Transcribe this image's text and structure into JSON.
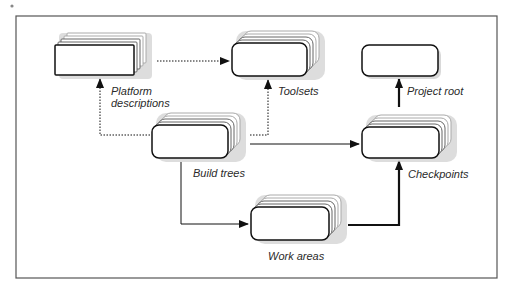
{
  "frame": {
    "x": 16,
    "y": 16,
    "width": 481,
    "height": 262,
    "stroke": "#555555"
  },
  "colors": {
    "box_fill": "#ffffff",
    "box_stroke": "#111111",
    "stack_stroke": "#666666",
    "shadow": "#cfcfcf",
    "line": "#111111"
  },
  "nodes": [
    {
      "id": "platform",
      "label_lines": [
        "Platform",
        "descriptions"
      ],
      "x": 55,
      "y": 45,
      "w": 79,
      "h": 30,
      "r": 1,
      "stacked": true,
      "label_x": 111,
      "label_y": 95
    },
    {
      "id": "toolsets",
      "label_lines": [
        "Toolsets"
      ],
      "x": 232,
      "y": 43,
      "w": 75,
      "h": 33,
      "r": 7,
      "stacked": true,
      "label_x": 278,
      "label_y": 95
    },
    {
      "id": "project_root",
      "label_lines": [
        "Project root"
      ],
      "x": 362,
      "y": 45,
      "w": 76,
      "h": 31,
      "r": 7,
      "stacked": false,
      "label_x": 407,
      "label_y": 95
    },
    {
      "id": "build_trees",
      "label_lines": [
        "Build trees"
      ],
      "x": 152,
      "y": 125,
      "w": 76,
      "h": 33,
      "r": 7,
      "stacked": true,
      "label_x": 193,
      "label_y": 177
    },
    {
      "id": "checkpoints",
      "label_lines": [
        "Checkpoints"
      ],
      "x": 362,
      "y": 127,
      "w": 77,
      "h": 31,
      "r": 7,
      "stacked": true,
      "label_x": 407,
      "label_y": 178
    },
    {
      "id": "work_areas",
      "label_lines": [
        "Work areas"
      ],
      "x": 251,
      "y": 207,
      "w": 78,
      "h": 33,
      "r": 7,
      "stacked": true,
      "label_x": 268,
      "label_y": 260
    }
  ],
  "edges": [
    {
      "from": "platform",
      "to": "toolsets",
      "style": "dotted",
      "points": [
        [
          157,
          61
        ],
        [
          229,
          61
        ]
      ]
    },
    {
      "from": "build_trees",
      "to": "platform",
      "style": "dotted",
      "points": [
        [
          150,
          135
        ],
        [
          100,
          135
        ],
        [
          100,
          79
        ]
      ]
    },
    {
      "from": "build_trees",
      "to": "toolsets",
      "style": "dotted",
      "points": [
        [
          250,
          135
        ],
        [
          268,
          135
        ],
        [
          268,
          80
        ]
      ]
    },
    {
      "from": "build_trees",
      "to": "checkpoints",
      "style": "solid",
      "points": [
        [
          250,
          144
        ],
        [
          359,
          144
        ]
      ]
    },
    {
      "from": "build_trees",
      "to": "work_areas",
      "style": "solid",
      "points": [
        [
          181,
          162
        ],
        [
          181,
          224
        ],
        [
          248,
          224
        ]
      ]
    },
    {
      "from": "work_areas",
      "to": "checkpoints",
      "style": "thick",
      "points": [
        [
          348,
          225
        ],
        [
          399,
          225
        ],
        [
          399,
          161
        ]
      ]
    },
    {
      "from": "checkpoints",
      "to": "project_root",
      "style": "thick",
      "points": [
        [
          399,
          107
        ],
        [
          399,
          79
        ]
      ]
    }
  ],
  "labels": {
    "platform_1": "Platform",
    "platform_2": "descriptions",
    "toolsets": "Toolsets",
    "project_root": "Project root",
    "build_trees": "Build trees",
    "checkpoints": "Checkpoints",
    "work_areas": "Work areas"
  }
}
